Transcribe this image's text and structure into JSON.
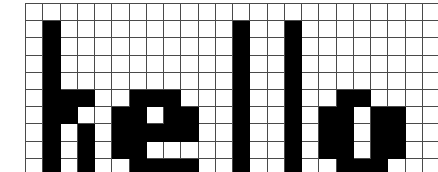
{
  "figure": {
    "word": "hello",
    "grid": {
      "columns": 24,
      "rows": 10,
      "cell_size_px": 16,
      "line_color": "#4a4a4a",
      "fill_color": "#000000",
      "background_color": "#ffffff"
    }
  },
  "chart_data": {
    "type": "heatmap",
    "xlabel": "",
    "ylabel": "",
    "columns": 24,
    "rows": 10,
    "legend": [
      "0 = empty (white)",
      "1 = filled (black)"
    ],
    "values": [
      [
        0,
        0,
        0,
        0,
        0,
        0,
        0,
        0,
        0,
        0,
        0,
        0,
        0,
        0,
        0,
        0,
        0,
        0,
        0,
        0,
        0,
        0,
        0,
        0
      ],
      [
        0,
        1,
        0,
        0,
        0,
        0,
        0,
        0,
        0,
        0,
        0,
        0,
        1,
        0,
        0,
        1,
        0,
        0,
        0,
        0,
        0,
        0,
        0,
        0
      ],
      [
        0,
        1,
        0,
        0,
        0,
        0,
        0,
        0,
        0,
        0,
        0,
        0,
        1,
        0,
        0,
        1,
        0,
        0,
        0,
        0,
        0,
        0,
        0,
        0
      ],
      [
        0,
        1,
        0,
        0,
        0,
        0,
        0,
        0,
        0,
        0,
        0,
        0,
        1,
        0,
        0,
        1,
        0,
        0,
        0,
        0,
        0,
        0,
        0,
        0
      ],
      [
        0,
        1,
        0,
        0,
        0,
        0,
        0,
        0,
        0,
        0,
        0,
        0,
        1,
        0,
        0,
        1,
        0,
        0,
        0,
        0,
        0,
        0,
        0,
        0
      ],
      [
        0,
        1,
        1,
        1,
        0,
        0,
        1,
        1,
        1,
        0,
        0,
        0,
        1,
        0,
        0,
        1,
        0,
        0,
        1,
        1,
        0,
        0,
        0,
        0
      ],
      [
        0,
        1,
        1,
        0,
        0,
        1,
        1,
        0,
        1,
        1,
        0,
        0,
        1,
        0,
        0,
        1,
        0,
        1,
        1,
        0,
        1,
        1,
        0,
        0
      ],
      [
        0,
        1,
        0,
        1,
        0,
        1,
        1,
        1,
        1,
        1,
        0,
        0,
        1,
        0,
        0,
        1,
        0,
        1,
        1,
        0,
        1,
        1,
        0,
        0
      ],
      [
        0,
        1,
        0,
        1,
        0,
        1,
        1,
        0,
        0,
        0,
        0,
        0,
        1,
        0,
        0,
        1,
        0,
        1,
        1,
        0,
        1,
        1,
        0,
        0
      ],
      [
        0,
        1,
        0,
        1,
        0,
        0,
        1,
        1,
        1,
        1,
        0,
        0,
        1,
        0,
        0,
        1,
        0,
        0,
        1,
        1,
        1,
        0,
        0,
        0
      ]
    ]
  }
}
